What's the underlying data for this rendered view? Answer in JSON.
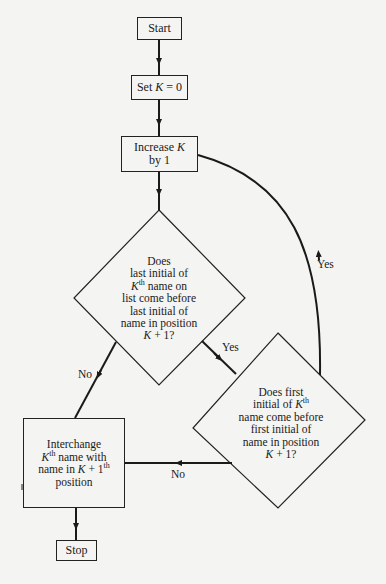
{
  "flowchart": {
    "nodes": {
      "start": {
        "type": "terminal",
        "label": "Start"
      },
      "init": {
        "type": "process",
        "label_prefix": "Set ",
        "var": "K",
        "label_suffix": " = 0"
      },
      "increment": {
        "type": "process",
        "line1_prefix": "Increase ",
        "var": "K",
        "line2": "by 1"
      },
      "decision_last_initial": {
        "type": "decision",
        "lines": [
          "Does",
          "last initial of",
          "K|th| name on",
          "list come before",
          "last initial of",
          "name in position",
          "K + 1?"
        ],
        "line1": "Does",
        "line2": "last initial of",
        "line3_var": "K",
        "line3_sup": "th",
        "line3_rest": " name on",
        "line4": "list come before",
        "line5": "last initial of",
        "line6": "name in position",
        "line7_var": "K",
        "line7_rest": " + 1?"
      },
      "decision_first_initial": {
        "type": "decision",
        "line1": "Does first",
        "line2_prefix": "initial of ",
        "line2_var": "K",
        "line2_sup": "th",
        "line3": "name come before",
        "line4": "first initial of",
        "line5": "name in position",
        "line6_var": "K",
        "line6_rest": " + 1?"
      },
      "interchange": {
        "type": "process",
        "line1": "Interchange",
        "line2_var": "K",
        "line2_sup": "th",
        "line2_rest": " name with",
        "line3_prefix": "name in ",
        "line3_var": "K",
        "line3_mid": " + 1",
        "line3_sup": "th",
        "line4": "position"
      },
      "stop": {
        "type": "terminal",
        "label": "Stop"
      }
    },
    "edge_labels": {
      "d1_yes": "Yes",
      "d1_no": "No",
      "d2_yes": "Yes",
      "d2_no": "No"
    },
    "edges": [
      {
        "from": "start",
        "to": "init"
      },
      {
        "from": "init",
        "to": "increment"
      },
      {
        "from": "increment",
        "to": "decision_last_initial"
      },
      {
        "from": "decision_last_initial",
        "to": "decision_first_initial",
        "label": "Yes"
      },
      {
        "from": "decision_last_initial",
        "to": "interchange",
        "label": "No"
      },
      {
        "from": "decision_first_initial",
        "to": "increment",
        "label": "Yes"
      },
      {
        "from": "decision_first_initial",
        "to": "interchange",
        "label": "No"
      },
      {
        "from": "interchange",
        "to": "stop"
      }
    ],
    "colors": {
      "line": "#1a1a1a",
      "background": "#f4f4f2"
    }
  }
}
